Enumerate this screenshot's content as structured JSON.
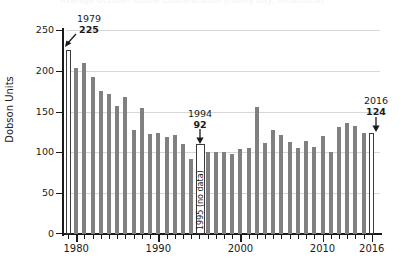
{
  "title_clipped": "Average October Ozone Concentration (Halley Bay, Antarctica)",
  "axes": {
    "ylabel": "Dobson Units",
    "yticks": [
      "0",
      "50",
      "100",
      "150",
      "200",
      "250"
    ],
    "xticks_major": [
      "1980",
      "1990",
      "2000",
      "2010",
      "2016"
    ]
  },
  "annotations": [
    {
      "name": "first-year",
      "year": "1979",
      "value": "225"
    },
    {
      "name": "minimum-year",
      "year": "1994",
      "value": "92"
    },
    {
      "name": "last-year",
      "year": "2016",
      "value": "124"
    },
    {
      "name": "no-data-year",
      "label": "1995 (no data)"
    }
  ],
  "colors": {
    "bar": "#808080",
    "highlight_bar_fill": "#ffffff",
    "highlight_bar_stroke": "#3a3a3a",
    "grid": "#d8d8d8",
    "axis": "#1a1a1a"
  },
  "chart_data": {
    "type": "bar",
    "title": "Average October Ozone Concentration (Halley Bay, Antarctica)",
    "xlabel": "",
    "ylabel": "Dobson Units",
    "ylim": [
      0,
      250
    ],
    "xlim": [
      1979,
      2016
    ],
    "grid": true,
    "legend": null,
    "categories": [
      "1979",
      "1980",
      "1981",
      "1982",
      "1983",
      "1984",
      "1985",
      "1986",
      "1987",
      "1988",
      "1989",
      "1990",
      "1991",
      "1992",
      "1993",
      "1994",
      "1995",
      "1996",
      "1997",
      "1998",
      "1999",
      "2000",
      "2001",
      "2002",
      "2003",
      "2004",
      "2005",
      "2006",
      "2007",
      "2008",
      "2009",
      "2010",
      "2011",
      "2012",
      "2013",
      "2014",
      "2015",
      "2016"
    ],
    "values": [
      225,
      203,
      210,
      193,
      175,
      172,
      157,
      168,
      127,
      155,
      123,
      124,
      119,
      121,
      110,
      92,
      null,
      100,
      101,
      101,
      98,
      104,
      105,
      156,
      112,
      127,
      121,
      113,
      105,
      114,
      107,
      120,
      100,
      131,
      136,
      132,
      124,
      124
    ],
    "highlighted": [
      "1979",
      "2016"
    ],
    "no_data": [
      "1995"
    ],
    "data_labels": {
      "1979": 225,
      "1994": 92,
      "2016": 124
    }
  }
}
